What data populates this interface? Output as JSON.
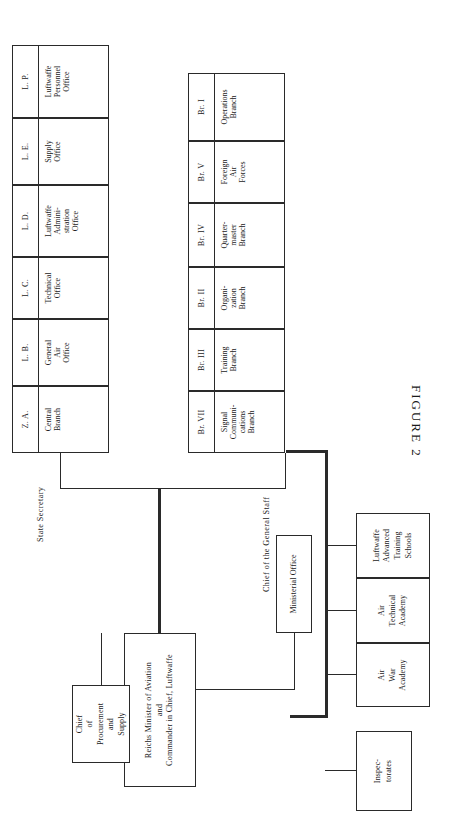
{
  "figure": {
    "caption": "FIGURE  2"
  },
  "root": {
    "lines": [
      "Reichs Minister of Aviation",
      "and",
      "Commander in Chief, Luftwaffe"
    ]
  },
  "ministerial_office": {
    "lines": [
      "Ministerial Office"
    ]
  },
  "procurement": {
    "lines": [
      "Chief",
      "of",
      "Procurement",
      "and",
      "Supply"
    ]
  },
  "inspectorates": {
    "lines": [
      "Inspec-",
      "torates"
    ]
  },
  "groups": [
    {
      "id": "state-secretary",
      "label": "State Secretary",
      "cells": [
        {
          "code": "Z. A.",
          "lines": [
            "Central",
            "Branch"
          ]
        },
        {
          "code": "L. B.",
          "lines": [
            "General",
            "Air",
            "Office"
          ]
        },
        {
          "code": "L. C.",
          "lines": [
            "Technical",
            "Office"
          ]
        },
        {
          "code": "L. D.",
          "lines": [
            "Luftwaffe",
            "Admini-",
            "stration",
            "Office"
          ]
        },
        {
          "code": "L. E.",
          "lines": [
            "Supply",
            "Office"
          ]
        },
        {
          "code": "L. P.",
          "lines": [
            "Luftwaffe",
            "Personnel",
            "Office"
          ]
        }
      ]
    },
    {
      "id": "general-staff",
      "label": "Chief of the General Staff",
      "cells": [
        {
          "code": "Br. I",
          "lines": [
            "Operations",
            "Branch"
          ]
        },
        {
          "code": "Br. V",
          "lines": [
            "Foreign",
            "Air",
            "Forces"
          ]
        },
        {
          "code": "Br. IV",
          "lines": [
            "Quarter-",
            "master",
            "Branch"
          ]
        },
        {
          "code": "Br. II",
          "lines": [
            "Organi-",
            "zation",
            "Branch"
          ]
        },
        {
          "code": "Br. III",
          "lines": [
            "Training",
            "Branch"
          ]
        },
        {
          "code": "Br. VII",
          "lines": [
            "Signal",
            "Communi-",
            "cations",
            "Branch"
          ]
        }
      ]
    }
  ],
  "schools": [
    {
      "lines": [
        "Air",
        "War",
        "Academy"
      ]
    },
    {
      "lines": [
        "Air",
        "Technical",
        "Academy"
      ]
    },
    {
      "lines": [
        "Luftwaffe",
        "Advanced",
        "Training",
        "Schools"
      ]
    }
  ]
}
